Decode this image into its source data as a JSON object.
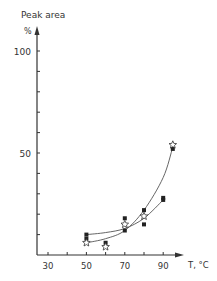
{
  "chart_data": {
    "type": "scatter",
    "title": "",
    "ylabel": "Peak area",
    "yunit": "%",
    "xlabel": "T, °C",
    "xlim": [
      25,
      100
    ],
    "ylim": [
      0,
      110
    ],
    "x_ticks": [
      30,
      40,
      50,
      60,
      70,
      80,
      90
    ],
    "x_tick_labels": [
      "30",
      "50",
      "70",
      "90"
    ],
    "y_ticks": [
      10,
      20,
      30,
      40,
      50,
      60,
      70,
      80,
      90,
      100
    ],
    "y_tick_labels": [
      "50",
      "100"
    ],
    "grid": false,
    "legend": null,
    "series": [
      {
        "name": "filled squares (upper)",
        "marker": "filled-square",
        "points": [
          [
            50,
            10
          ],
          [
            60,
            6
          ],
          [
            70,
            18
          ],
          [
            80,
            22
          ],
          [
            90,
            28
          ],
          [
            95,
            52
          ]
        ]
      },
      {
        "name": "filled squares (lower)",
        "marker": "filled-square",
        "points": [
          [
            50,
            8
          ],
          [
            70,
            12
          ],
          [
            80,
            15
          ],
          [
            90,
            27
          ]
        ]
      },
      {
        "name": "open stars",
        "marker": "open-star",
        "points": [
          [
            50,
            6
          ],
          [
            60,
            4
          ],
          [
            70,
            15
          ],
          [
            80,
            19
          ],
          [
            95,
            54
          ]
        ]
      }
    ],
    "curves": [
      {
        "name": "fit-upper",
        "points": [
          [
            50,
            6
          ],
          [
            60,
            8
          ],
          [
            70,
            12
          ],
          [
            80,
            22
          ],
          [
            90,
            38
          ],
          [
            95,
            53
          ]
        ]
      },
      {
        "name": "fit-lower",
        "points": [
          [
            50,
            10
          ],
          [
            60,
            11
          ],
          [
            70,
            13
          ],
          [
            80,
            18
          ],
          [
            90,
            27
          ]
        ]
      }
    ]
  }
}
